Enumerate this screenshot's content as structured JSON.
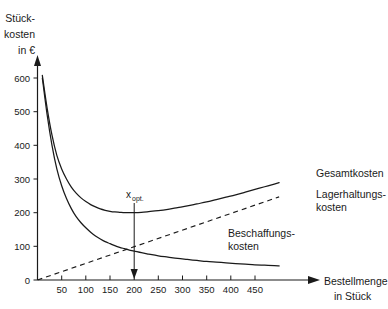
{
  "chart_data": {
    "type": "line",
    "title": "",
    "xlabel": "Bestellmenge in Stück",
    "ylabel": "Stückkosten in €",
    "ylabel_lines": [
      "Stück-",
      "kosten",
      "in €"
    ],
    "xlabel_lines": [
      "Bestellmenge",
      "in Stück"
    ],
    "xlim": [
      0,
      500
    ],
    "ylim": [
      0,
      640
    ],
    "grid": false,
    "legend_position": "right-inline",
    "x_ticks": [
      50,
      100,
      150,
      200,
      250,
      300,
      350,
      400,
      450
    ],
    "x_tick_labels": [
      "50",
      "100",
      "150",
      "200",
      "250",
      "300",
      "350",
      "400",
      "450"
    ],
    "y_ticks": [
      0,
      100,
      200,
      300,
      400,
      500,
      600
    ],
    "y_tick_labels": [
      "0",
      "100",
      "200",
      "300",
      "400",
      "500",
      "600"
    ],
    "annotations": [
      {
        "name": "x-optimum",
        "text": "x",
        "subscript": "opt.",
        "x": 200,
        "y_from": 200,
        "y_to": 0,
        "style": "down-arrow"
      }
    ],
    "series": [
      {
        "name": "Gesamtkosten",
        "label": "Gesamtkosten",
        "style": "solid",
        "color": "#1a1a1a",
        "x": [
          10,
          20,
          30,
          40,
          50,
          60,
          70,
          80,
          90,
          100,
          110,
          120,
          130,
          140,
          150,
          160,
          170,
          180,
          190,
          200,
          215,
          230,
          250,
          270,
          290,
          310,
          330,
          350,
          370,
          390,
          410,
          430,
          450,
          470,
          490,
          500
        ],
        "values": [
          608,
          510,
          430,
          370,
          330,
          300,
          276,
          258,
          244,
          233,
          224,
          217,
          211,
          207,
          204,
          202,
          201,
          200,
          200,
          200,
          201,
          203,
          206,
          210,
          215,
          220,
          226,
          232,
          239,
          246,
          253,
          261,
          269,
          277,
          285,
          289
        ]
      },
      {
        "name": "Beschaffungskosten",
        "label": "Beschaffungskosten",
        "style": "solid",
        "color": "#1a1a1a",
        "x": [
          10,
          20,
          30,
          40,
          50,
          60,
          70,
          80,
          90,
          100,
          110,
          120,
          130,
          140,
          150,
          160,
          170,
          180,
          190,
          200,
          215,
          230,
          250,
          270,
          290,
          310,
          330,
          350,
          370,
          390,
          410,
          430,
          450,
          470,
          490,
          500
        ],
        "values": [
          600,
          490,
          400,
          330,
          280,
          242,
          212,
          188,
          170,
          155,
          142,
          131,
          122,
          114,
          108,
          102,
          97,
          93,
          89,
          86,
          81,
          77,
          72,
          68,
          64,
          61,
          58,
          55,
          53,
          51,
          49,
          47,
          45,
          44,
          43,
          42
        ]
      },
      {
        "name": "Lagerhaltungskosten",
        "label": "Lagerhaltungskosten",
        "style": "dashed",
        "color": "#1a1a1a",
        "x": [
          0,
          500
        ],
        "values": [
          0,
          247
        ]
      }
    ],
    "series_label_lines": {
      "Gesamtkosten": [
        "Gesamtkosten"
      ],
      "Lagerhaltungskosten": [
        "Lagerhaltungs-",
        "kosten"
      ],
      "Beschaffungskosten": [
        "Beschaffungs-",
        "kosten"
      ]
    }
  },
  "colors": {
    "ink": "#1a1a1a",
    "background": "#ffffff"
  }
}
